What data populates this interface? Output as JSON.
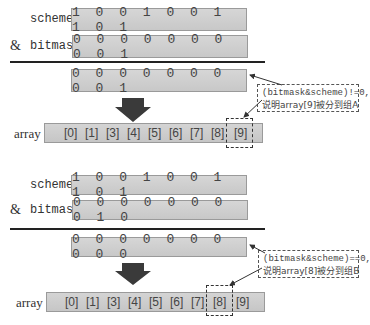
{
  "sections": [
    {
      "scheme_label": "scheme",
      "amp_label": "&",
      "bitmask_label": "bitmask",
      "scheme_bits": "1 0 0 1 0 0 1 1 0 1",
      "bitmask_bits": "0 0 0 0 0 0 0 0 0 1",
      "result_bits": "0 0 0 0 0 0 0 0 0 1",
      "array_label": "array",
      "array_cells": [
        "[0]",
        "[1]",
        "[3]",
        "[4]",
        "[5]",
        "[6]",
        "[7]",
        "[8]",
        "[9]"
      ],
      "highlighted_cell": "[9]",
      "note_line1": "(bitmask&scheme)!=0,",
      "note_line2": "说明array[9]被分到组A"
    },
    {
      "scheme_label": "scheme",
      "amp_label": "&",
      "bitmask_label": "bitmask",
      "scheme_bits": "1 0 0 1 0 0 1 1 0 1",
      "bitmask_bits": "0 0 0 0 0 0 0 0 1 0",
      "result_bits": "0 0 0 0 0 0 0 0 0 0",
      "array_label": "array",
      "array_cells": [
        "[0]",
        "[1]",
        "[3]",
        "[4]",
        "[5]",
        "[6]",
        "[7]",
        "[8]",
        "[9]"
      ],
      "highlighted_cell": "[8]",
      "note_line1": "(bitmask&scheme)==0,",
      "note_line2": "说明array[8]被分到组B"
    }
  ],
  "colors": {
    "box_fill": "#cfcfcf",
    "box_border": "#9a9a9a",
    "arrow": "#3a3a3a",
    "divider": "#222222"
  }
}
